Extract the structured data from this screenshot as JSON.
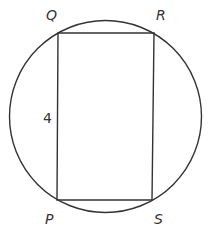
{
  "diagram": {
    "type": "rectangle-inscribed-in-circle",
    "circle": {
      "cx": 105.5,
      "cy": 116.5,
      "r": 96
    },
    "vertices": {
      "Q": {
        "label": "Q",
        "x": 58,
        "y": 33
      },
      "R": {
        "label": "R",
        "x": 154,
        "y": 33
      },
      "S": {
        "label": "S",
        "x": 152,
        "y": 200
      },
      "P": {
        "label": "P",
        "x": 57,
        "y": 200
      }
    },
    "side_labels": [
      {
        "side": "PQ",
        "text": "4"
      }
    ],
    "stroke_color": "#333333",
    "background": "#ffffff"
  }
}
